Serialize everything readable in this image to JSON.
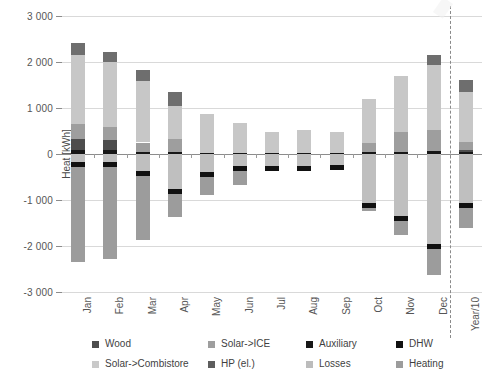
{
  "chart_data": {
    "type": "bar",
    "subtype": "stacked-bar-diverging",
    "title": "",
    "xlabel": "",
    "ylabel": "Heat [kWh]",
    "ylim": [
      -3000,
      3000
    ],
    "ytick_values": [
      3000,
      2000,
      1000,
      0,
      -1000,
      -2000,
      -3000
    ],
    "ytick_labels": [
      "3 000",
      "2 000",
      "1 000",
      "0",
      "-1 000",
      "-2 000",
      "-3 000"
    ],
    "grid": true,
    "grid_axis": "y",
    "legend_position": "bottom",
    "categories": [
      "Jan",
      "Feb",
      "Mar",
      "Apr",
      "May",
      "Jun",
      "Jul",
      "Aug",
      "Sep",
      "Oct",
      "Nov",
      "Dec",
      "Year/10"
    ],
    "annotations": [
      {
        "type": "vertical-dashed-line",
        "after_category": "Dec",
        "label": ""
      }
    ],
    "series": [
      {
        "name": "Auxiliary",
        "color": "#171717",
        "stack": "positive",
        "values": [
          80,
          95,
          35,
          35,
          30,
          30,
          30,
          30,
          30,
          50,
          40,
          70,
          45
        ]
      },
      {
        "name": "Wood",
        "color": "#4d4d4d",
        "stack": "positive",
        "values": [
          250,
          200,
          0,
          0,
          0,
          0,
          0,
          0,
          0,
          0,
          0,
          0,
          40
        ]
      },
      {
        "name": "Solar->Combistore",
        "color": "#9e9e9e",
        "stack": "positive",
        "values": [
          330,
          300,
          215,
          300,
          0,
          0,
          0,
          0,
          0,
          180,
          430,
          460,
          175
        ]
      },
      {
        "name": "Solar->ICE",
        "color": "#c7c7c7",
        "stack": "positive",
        "values": [
          1490,
          1400,
          1330,
          705,
          835,
          640,
          450,
          490,
          450,
          960,
          1230,
          1400,
          1080
        ]
      },
      {
        "name": "HP (el.)",
        "color": "#6e6e6e",
        "stack": "positive-top",
        "values": [
          260,
          215,
          250,
          300,
          0,
          0,
          0,
          0,
          0,
          0,
          0,
          220,
          260
        ]
      },
      {
        "name": "Losses",
        "color": "#bfbfbf",
        "stack": "negative",
        "values": [
          -180,
          -170,
          -360,
          -760,
          -400,
          -265,
          -255,
          -250,
          -245,
          -1070,
          -1340,
          -1950,
          -1060
        ]
      },
      {
        "name": "DHW",
        "color": "#111111",
        "stack": "negative",
        "values": [
          -105,
          -110,
          -110,
          -110,
          -110,
          -110,
          -110,
          -110,
          -110,
          -110,
          -110,
          -110,
          -110
        ]
      },
      {
        "name": "Heating",
        "color": "#9c9c9c",
        "stack": "negative",
        "values": [
          -2060,
          -2010,
          -1400,
          -500,
          -375,
          -290,
          0,
          0,
          0,
          -60,
          -310,
          -560,
          -430
        ]
      }
    ],
    "bar_totals_positive": [
      2410,
      2210,
      1830,
      1340,
      865,
      670,
      480,
      520,
      480,
      1190,
      1700,
      2150,
      1600
    ],
    "bar_totals_negative": [
      -2345,
      -2290,
      -1870,
      -1370,
      -885,
      -665,
      -365,
      -360,
      -355,
      -1240,
      -1760,
      -2620,
      -1600
    ]
  },
  "legend": {
    "items": [
      {
        "label": "Wood",
        "color": "#4d4d4d"
      },
      {
        "label": "Solar->ICE",
        "color": "#9e9e9e"
      },
      {
        "label": "Auxiliary",
        "color": "#171717"
      },
      {
        "label": "DHW",
        "color": "#111111"
      },
      {
        "label": "Solar->Combistore",
        "color": "#c9c9c9"
      },
      {
        "label": "HP (el.)",
        "color": "#5d5d5d"
      },
      {
        "label": "Losses",
        "color": "#bcbcbc"
      },
      {
        "label": "Heating",
        "color": "#9c9c9c"
      }
    ]
  }
}
